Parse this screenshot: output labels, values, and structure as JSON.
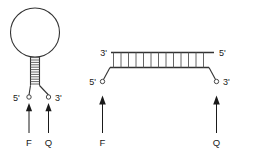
{
  "figure": {
    "background_color": "#ffffff",
    "line_color": "#333333",
    "rung_color": "#555555",
    "text_color": "#1a1a1a"
  },
  "closed_state": {
    "name": "hairpin-stem-loop",
    "loop": {
      "label": "loop"
    },
    "stem": {
      "base_pair_count": 12
    },
    "end_labels": {
      "five_prime": "5'",
      "three_prime": "3'"
    },
    "markers": [
      {
        "id": "fluorophore",
        "label": "F",
        "attached_to": "5'"
      },
      {
        "id": "quencher",
        "label": "Q",
        "attached_to": "3'"
      }
    ]
  },
  "open_state": {
    "name": "hybridized-duplex",
    "duplex": {
      "base_pair_count": 13
    },
    "top_strand_labels": {
      "left": "3'",
      "right": "5'"
    },
    "bottom_strand_labels": {
      "left": "5'",
      "right": "3'"
    },
    "markers": [
      {
        "id": "fluorophore",
        "label": "F",
        "attached_to": "5'"
      },
      {
        "id": "quencher",
        "label": "Q",
        "attached_to": "3'"
      }
    ]
  }
}
